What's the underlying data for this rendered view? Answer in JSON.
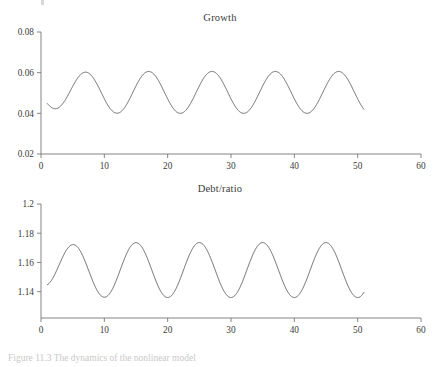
{
  "figure": {
    "caption": "Figure 11.3  The dynamics of the nonlinear model",
    "background": "#ffffff",
    "line_color": "#555555",
    "axis_color": "#777777"
  },
  "chart_data": [
    {
      "type": "line",
      "title": "Growth",
      "xlabel": "",
      "ylabel": "",
      "xlim": [
        0,
        60
      ],
      "ylim": [
        0.02,
        0.08
      ],
      "xticks": [
        0,
        10,
        20,
        30,
        40,
        50,
        60
      ],
      "xticklabels": [
        "0",
        "10",
        "20",
        "30",
        "40",
        "50",
        "60"
      ],
      "yticks": [
        0.02,
        0.04,
        0.06,
        0.08
      ],
      "yticklabels": [
        "0.02",
        "0.04",
        "0.06",
        "0.08"
      ],
      "grid": false,
      "legend": false,
      "series": [
        {
          "name": "Growth",
          "x_start": 1,
          "x_end": 51,
          "mean": 0.0503,
          "amplitude": 0.0103,
          "period": 10.0,
          "phase_peak_x": 7,
          "min": 0.04,
          "max": 0.0605,
          "peaks_x": [
            7,
            17,
            27,
            37,
            47
          ],
          "troughs_x": [
            2,
            12,
            22,
            32,
            42
          ],
          "start_value": 0.0405,
          "end_value": 0.0415
        }
      ]
    },
    {
      "type": "line",
      "title": "Debt/ratio",
      "xlabel": "",
      "ylabel": "",
      "xlim": [
        0,
        60
      ],
      "ylim": [
        1.122,
        1.2
      ],
      "xticks": [
        0,
        10,
        20,
        30,
        40,
        50,
        60
      ],
      "xticklabels": [
        "0",
        "10",
        "20",
        "30",
        "40",
        "50",
        "60"
      ],
      "yticks": [
        1.14,
        1.16,
        1.18,
        1.2
      ],
      "yticklabels": [
        "1.14",
        "1.16",
        "1.18",
        "1.2"
      ],
      "grid": false,
      "legend": false,
      "series": [
        {
          "name": "Debt/ratio",
          "x_start": 1,
          "x_end": 51,
          "mean": 1.1548,
          "amplitude": 0.0188,
          "period": 10.0,
          "phase_peak_x": 5,
          "min": 1.136,
          "max": 1.1735,
          "peaks_x": [
            5,
            15,
            25,
            35,
            45
          ],
          "troughs_x": [
            10,
            20,
            30,
            40,
            50
          ],
          "start_value": 1.138,
          "end_value": 1.1385
        }
      ]
    }
  ]
}
